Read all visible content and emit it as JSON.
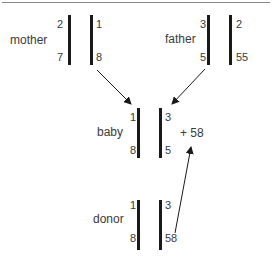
{
  "diagram": {
    "mother": {
      "label": "mother",
      "allele_left_top": "2",
      "allele_left_bottom": "7",
      "allele_right_top": "1",
      "allele_right_bottom": "8"
    },
    "father": {
      "label": "father",
      "allele_left_top": "3",
      "allele_left_bottom": "5",
      "allele_right_top": "2",
      "allele_right_bottom": "55"
    },
    "baby": {
      "label": "baby",
      "allele_left_top": "1",
      "allele_left_bottom": "8",
      "allele_right_top": "3",
      "allele_right_bottom": "5",
      "extra": "+ 58"
    },
    "donor": {
      "label": "donor",
      "allele_left_top": "1",
      "allele_left_bottom": "8",
      "allele_right_top": "3",
      "allele_right_bottom": "58"
    },
    "arrows": [
      {
        "from": "mother",
        "to": "baby"
      },
      {
        "from": "father",
        "to": "baby"
      },
      {
        "from": "donor-58",
        "to": "baby-extra-58"
      }
    ]
  }
}
